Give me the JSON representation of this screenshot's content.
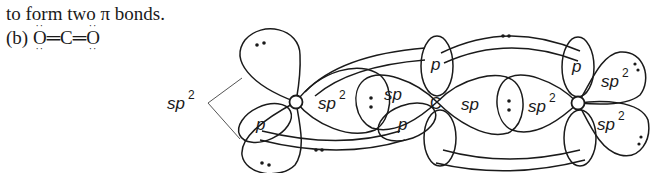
{
  "caption": {
    "line1": "to form two π bonds.",
    "line2_prefix": "(b) ",
    "formula": {
      "atom1": "O",
      "bond1": "═",
      "atom2": "C",
      "bond2": "═",
      "atom3": "O",
      "lone_pair_dots": "··"
    }
  },
  "diagram": {
    "atoms": [
      {
        "id": "O-left",
        "label": "O",
        "hybridization": "sp2"
      },
      {
        "id": "C-center",
        "label": "C",
        "hybridization": "sp"
      },
      {
        "id": "O-right",
        "label": "O",
        "hybridization": "sp2"
      }
    ],
    "labels": {
      "sp2_callout": "sp",
      "sp2_callout_sup": "2",
      "left_p": "p",
      "left_sigma_sp2": "sp",
      "left_sigma_sp2_sup": "2",
      "c_sp_left": "sp",
      "c_p_lower": "p",
      "c_p_upper": "p",
      "c_sp_right": "sp",
      "right_sigma_sp2": "sp",
      "right_sigma_sp2_sup": "2",
      "right_p": "p",
      "right_sp2_upper": "sp",
      "right_sp2_upper_sup": "2",
      "right_sp2_lower": "sp",
      "right_sp2_lower_sup": "2"
    },
    "bonds": [
      {
        "type": "sigma",
        "between": [
          "O-left",
          "C-center"
        ],
        "electrons": ":"
      },
      {
        "type": "sigma",
        "between": [
          "C-center",
          "O-right"
        ],
        "electrons": ":"
      },
      {
        "type": "pi",
        "between": [
          "O-left",
          "C-center"
        ],
        "electrons": "··"
      },
      {
        "type": "pi",
        "between": [
          "C-center",
          "O-right"
        ],
        "electrons": "··"
      }
    ],
    "lone_pairs": [
      {
        "atom": "O-left",
        "orbital": "sp2 upper"
      },
      {
        "atom": "O-left",
        "orbital": "sp2 lower"
      },
      {
        "atom": "O-right",
        "orbital": "sp2 upper"
      },
      {
        "atom": "O-right",
        "orbital": "sp2 lower"
      }
    ],
    "colors": {
      "line": "#1a1a1a",
      "background": "#ffffff"
    }
  }
}
